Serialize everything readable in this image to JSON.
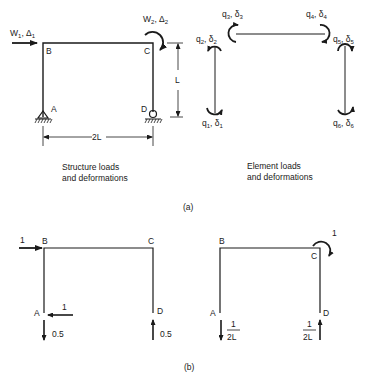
{
  "part_a": {
    "structure": {
      "nodes": {
        "a": "A",
        "b": "B",
        "c": "C",
        "d": "D"
      },
      "load_w1": {
        "symbol": "W",
        "sub": "1",
        "sep": ", ",
        "disp": "Δ",
        "disp_sub": "1"
      },
      "load_w2": {
        "symbol": "W",
        "sub": "2",
        "sep": ", ",
        "disp": "Δ",
        "disp_sub": "2"
      },
      "dim_height": "L",
      "dim_width": "2L",
      "caption_line1": "Structure loads",
      "caption_line2": "and deformations"
    },
    "elements": {
      "q1": {
        "q": "q",
        "sub": "1",
        "d": "δ",
        "dsub": "1"
      },
      "q2": {
        "q": "q",
        "sub": "2",
        "d": "δ",
        "dsub": "2"
      },
      "q3": {
        "q": "q",
        "sub": "3",
        "d": "δ",
        "dsub": "3"
      },
      "q4": {
        "q": "q",
        "sub": "4",
        "d": "δ",
        "dsub": "4"
      },
      "q5": {
        "q": "q",
        "sub": "5",
        "d": "δ",
        "dsub": "5"
      },
      "q6": {
        "q": "q",
        "sub": "6",
        "d": "δ",
        "dsub": "6"
      },
      "caption_line1": "Element loads",
      "caption_line2": "and deformations"
    },
    "label": "(a)"
  },
  "part_b": {
    "left": {
      "nodes": {
        "a": "A",
        "b": "B",
        "c": "C",
        "d": "D"
      },
      "load_b": "1",
      "reaction_a_horizontal": "1",
      "reaction_a_vertical": "0.5",
      "reaction_d_vertical": "0.5"
    },
    "right": {
      "nodes": {
        "a": "A",
        "b": "B",
        "c": "C",
        "d": "D"
      },
      "moment_c": "1",
      "reaction_a_num": "1",
      "reaction_a_den": "2L",
      "reaction_d_num": "1",
      "reaction_d_den": "2L"
    },
    "label": "(b)"
  }
}
